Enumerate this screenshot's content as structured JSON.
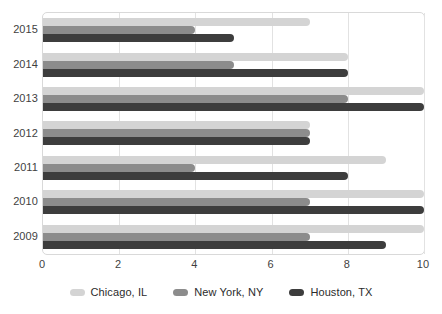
{
  "chart_data": {
    "type": "bar",
    "orientation": "horizontal",
    "title": "",
    "subtitle": "",
    "xlabel": "",
    "ylabel": "",
    "categories": [
      "2015",
      "2014",
      "2013",
      "2012",
      "2011",
      "2010",
      "2009"
    ],
    "series": [
      {
        "name": "Chicago, IL",
        "color": "#d4d4d4",
        "values": [
          7,
          8,
          10,
          7,
          9,
          10,
          10
        ]
      },
      {
        "name": "New York, NY",
        "color": "#8c8c8c",
        "values": [
          4,
          5,
          8,
          7,
          4,
          7,
          7
        ]
      },
      {
        "name": "Houston, TX",
        "color": "#3d3d3d",
        "values": [
          5,
          8,
          10,
          7,
          8,
          10,
          9
        ]
      }
    ],
    "xlim": [
      0,
      10
    ],
    "x_ticks": [
      "0",
      "2",
      "4",
      "6",
      "8",
      "10"
    ],
    "x_tick_values": [
      0,
      2,
      4,
      6,
      8,
      10
    ],
    "grid": "vertical",
    "legend_position": "bottom",
    "legend_entries": [
      "Chicago, IL",
      "New York, NY",
      "Houston, TX"
    ]
  },
  "legend": {
    "items": [
      {
        "label": "Chicago, IL"
      },
      {
        "label": "New York, NY"
      },
      {
        "label": "Houston, TX"
      }
    ]
  }
}
